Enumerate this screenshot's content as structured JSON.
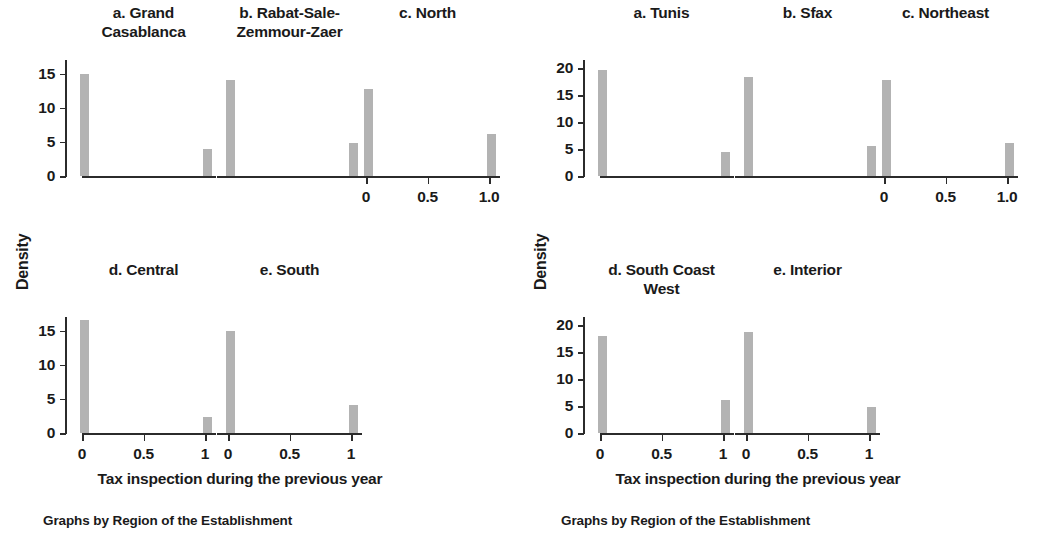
{
  "figures": [
    {
      "id": "figure-left",
      "ylabel": "Density",
      "xlabel": "Tax inspection during the previous year",
      "caption": "Graphs by Region of the Establishment",
      "yticks": [
        "0",
        "5",
        "10",
        "15"
      ],
      "xticks_long": [
        "0",
        "0.5",
        "1.0"
      ],
      "xticks_short": [
        "0",
        "0.5",
        "1"
      ],
      "panels": [
        {
          "title": "a. Grand\nCasablanca",
          "row": 0,
          "col": 0
        },
        {
          "title": "b. Rabat-Sale-\nZemmour-Zaer",
          "row": 0,
          "col": 1
        },
        {
          "title": "c. North",
          "row": 0,
          "col": 2
        },
        {
          "title": "d. Central",
          "row": 1,
          "col": 0
        },
        {
          "title": "e. South",
          "row": 1,
          "col": 1
        }
      ]
    },
    {
      "id": "figure-right",
      "ylabel": "Density",
      "xlabel": "Tax inspection during the previous year",
      "caption": "Graphs by Region of the Establishment",
      "yticks": [
        "0",
        "5",
        "10",
        "15",
        "20"
      ],
      "xticks_long": [
        "0",
        "0.5",
        "1.0"
      ],
      "xticks_short": [
        "0",
        "0.5",
        "1"
      ],
      "panels": [
        {
          "title": "a. Tunis",
          "row": 0,
          "col": 0
        },
        {
          "title": "b. Sfax",
          "row": 0,
          "col": 1
        },
        {
          "title": "c. Northeast",
          "row": 0,
          "col": 2
        },
        {
          "title": "d. South Coast\nWest",
          "row": 1,
          "col": 0
        },
        {
          "title": "e. Interior",
          "row": 1,
          "col": 1
        }
      ]
    }
  ],
  "chart_data": [
    {
      "type": "bar",
      "title": "Graphs by Region of the Establishment",
      "subtitle": "Morocco regions",
      "xlabel": "Tax inspection during the previous year",
      "ylabel": "Density",
      "ylim": [
        0,
        17
      ],
      "yticks": [
        0,
        5,
        10,
        15
      ],
      "xlim": [
        -0.12,
        1.12
      ],
      "xticks": [
        0,
        0.5,
        1
      ],
      "grid": false,
      "legend": "none",
      "bar_color": "#b3b3b3",
      "categories": [
        0,
        1
      ],
      "panels": [
        {
          "name": "a. Grand Casablanca",
          "values": [
            15.0,
            4.0
          ]
        },
        {
          "name": "b. Rabat-Sale-Zemmour-Zaer",
          "values": [
            14.1,
            4.9
          ]
        },
        {
          "name": "c. North",
          "values": [
            12.7,
            6.1
          ]
        },
        {
          "name": "d. Central",
          "values": [
            16.5,
            2.3
          ]
        },
        {
          "name": "e. South",
          "values": [
            14.9,
            4.1
          ]
        }
      ]
    },
    {
      "type": "bar",
      "title": "Graphs by Region of the Establishment",
      "subtitle": "Tunisia regions",
      "xlabel": "Tax inspection during the previous year",
      "ylabel": "Density",
      "ylim": [
        0,
        21.5
      ],
      "yticks": [
        0,
        5,
        10,
        15,
        20
      ],
      "xlim": [
        -0.12,
        1.12
      ],
      "xticks": [
        0,
        0.5,
        1
      ],
      "grid": false,
      "legend": "none",
      "bar_color": "#b3b3b3",
      "categories": [
        0,
        1
      ],
      "panels": [
        {
          "name": "a. Tunis",
          "values": [
            19.6,
            4.4
          ]
        },
        {
          "name": "b. Sfax",
          "values": [
            18.3,
            5.5
          ]
        },
        {
          "name": "c. Northeast",
          "values": [
            17.8,
            6.1
          ]
        },
        {
          "name": "d. South Coast West",
          "values": [
            17.9,
            6.1
          ]
        },
        {
          "name": "e. Interior",
          "values": [
            18.7,
            4.8
          ]
        }
      ]
    }
  ]
}
